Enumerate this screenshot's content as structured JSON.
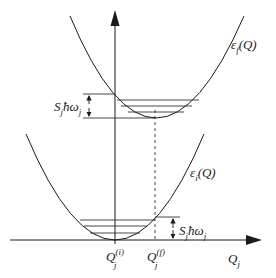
{
  "diagram": {
    "type": "configuration-coordinate-diagram",
    "colors": {
      "line": "#1a1a1a",
      "background": "#ffffff"
    },
    "axes": {
      "x_label": {
        "base": "Q",
        "sub": "j"
      },
      "y_arrow": true
    },
    "curves": {
      "upper": {
        "label_base": "ε",
        "label_sub": "f",
        "label_arg": "(Q)",
        "min_x": 155,
        "min_y": 118,
        "levels_y": [
          100,
          106,
          112
        ]
      },
      "lower": {
        "label_base": "ε",
        "label_sub": "i",
        "label_arg": "(Q)",
        "min_x": 115,
        "min_y": 240,
        "levels_y": [
          220,
          226,
          233
        ]
      }
    },
    "annotations": {
      "upper_gap": {
        "text_S": "S",
        "text_S_sub": "j",
        "text_hbar": "ħω",
        "text_omega_sub": "j"
      },
      "lower_gap": {
        "text_S": "S",
        "text_S_sub": "j",
        "text_hbar": "ħω",
        "text_omega_sub": "j"
      }
    },
    "ticks": {
      "qi": {
        "base": "Q",
        "sub": "j",
        "sup": "(i)"
      },
      "qf": {
        "base": "Q",
        "sub": "j",
        "sup": "(f)"
      }
    }
  }
}
